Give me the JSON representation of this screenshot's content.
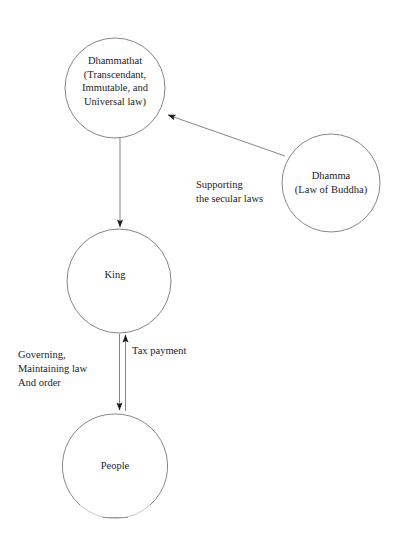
{
  "diagram": {
    "background_color": "#ffffff",
    "stroke_color": "#6f6f72",
    "text_color": "#1c1c1c",
    "nodes": [
      {
        "id": "dhammathat",
        "shape": "circle",
        "label": "Dhammathat\n(Transcendant,\nImmutable, and\nUniversal law)",
        "cx": 115,
        "cy": 88,
        "r": 50
      },
      {
        "id": "dhamma",
        "shape": "circle",
        "label": "Dhamma\n(Law of Buddha)",
        "cx": 331,
        "cy": 183,
        "r": 49
      },
      {
        "id": "king",
        "shape": "circle",
        "label": "King",
        "cx": 119,
        "cy": 281,
        "r": 52
      },
      {
        "id": "people",
        "shape": "circle",
        "label": "People",
        "cx": 115,
        "cy": 466,
        "r": 52
      }
    ],
    "edges": [
      {
        "id": "dhamma-to-dhammathat",
        "from": "dhamma",
        "to": "dhammathat",
        "label": "Supporting\nthe secular laws",
        "arrow": "single",
        "direction": "up-left"
      },
      {
        "id": "dhammathat-to-king",
        "from": "dhammathat",
        "to": "king",
        "label": "",
        "arrow": "single",
        "direction": "down"
      },
      {
        "id": "king-to-people",
        "from": "king",
        "to": "people",
        "label": "Governing,\nMaintaining law\nAnd order",
        "arrow": "single",
        "direction": "down"
      },
      {
        "id": "people-to-king",
        "from": "people",
        "to": "king",
        "label": "Tax payment",
        "arrow": "single",
        "direction": "up"
      }
    ]
  },
  "labels": {
    "dhammathat": "Dhammathat\n(Transcendant,\nImmutable, and\nUniversal law)",
    "dhamma": "Dhamma\n(Law of Buddha)",
    "king": "King",
    "people": "People",
    "supporting": "Supporting\nthe secular laws",
    "tax_payment": "Tax payment",
    "governing": "Governing,\nMaintaining law\nAnd order"
  }
}
